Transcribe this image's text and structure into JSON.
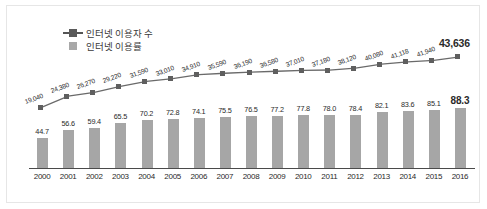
{
  "chart_data": {
    "type": "bar",
    "title": "",
    "subtitle": "",
    "xlabel": "",
    "ylabel": "",
    "grid": false,
    "legend_position": "top-left",
    "categories": [
      "2000",
      "2001",
      "2002",
      "2003",
      "2004",
      "2005",
      "2006",
      "2007",
      "2008",
      "2009",
      "2010",
      "2011",
      "2012",
      "2013",
      "2014",
      "2015",
      "2016"
    ],
    "series": [
      {
        "name": "인터넷 이용자 수",
        "type": "line",
        "marker": "square",
        "color": "#5f5f5f",
        "unit": "thousand persons",
        "values": [
          19040,
          24380,
          26270,
          29220,
          31590,
          33010,
          34910,
          35590,
          36190,
          36580,
          37010,
          37180,
          38120,
          40080,
          41118,
          41940,
          43636
        ],
        "labels": [
          "19,040",
          "24,380",
          "26,270",
          "29,220",
          "31,590",
          "33,010",
          "34,910",
          "35,590",
          "36,190",
          "36,580",
          "37,010",
          "37,180",
          "38,120",
          "40,080",
          "41,118",
          "41,940",
          "43,636"
        ],
        "ylim": [
          0,
          46000
        ]
      },
      {
        "name": "인터넷 이용률",
        "type": "bar",
        "color": "#a6a6a6",
        "unit": "%",
        "values": [
          44.7,
          56.6,
          59.4,
          65.5,
          70.2,
          72.8,
          74.1,
          75.5,
          76.5,
          77.2,
          77.8,
          78.0,
          78.4,
          82.1,
          83.6,
          85.1,
          88.3
        ],
        "labels": [
          "44.7",
          "56.6",
          "59.4",
          "65.5",
          "70.2",
          "72.8",
          "74.1",
          "75.5",
          "76.5",
          "77.2",
          "77.8",
          "78.0",
          "78.4",
          "82.1",
          "83.6",
          "85.1",
          "88.3"
        ],
        "ylim": [
          0,
          100
        ]
      }
    ]
  },
  "legend": {
    "items": [
      {
        "label": "인터넷 이용자 수",
        "marker": "line-square-marker",
        "color": "#5f5f5f"
      },
      {
        "label": "인터넷 이용률",
        "marker": "bar-square-marker",
        "color": "#a6a6a6"
      }
    ]
  },
  "colors": {
    "line": "#5f5f5f",
    "bar": "#a6a6a6",
    "axis": "#4a4a4a",
    "frame": "#e6e6e6",
    "text": "#2a2a2a"
  }
}
